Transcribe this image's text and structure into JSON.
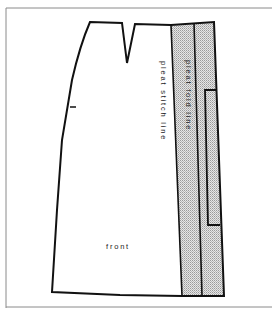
{
  "diagram": {
    "type": "sewing-pattern",
    "piece_label": "front",
    "labels": {
      "pleat_stitch_line": "pleat stitch line",
      "pleat_fold_line": "pleat fold line",
      "front": "front"
    },
    "colors": {
      "outline": "#111111",
      "frame": "#7a7a7a",
      "pleat_fill": "#d4d4d4",
      "background": "#ffffff"
    }
  }
}
